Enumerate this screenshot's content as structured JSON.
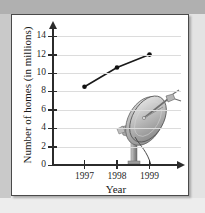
{
  "figure": {
    "panel_name": "line-graph-panel",
    "illustration": "satellite-dish-illustration"
  },
  "chart_data": {
    "type": "line",
    "title": "",
    "xlabel": "Year",
    "ylabel": "Number of homes (in millions)",
    "categories": [
      "1997",
      "1998",
      "1999"
    ],
    "x": [
      1997,
      1998,
      1999
    ],
    "values": [
      8.5,
      10.6,
      12.0
    ],
    "series": [
      {
        "name": "Number of homes",
        "values": [
          8.5,
          10.6,
          12.0
        ]
      }
    ],
    "xlim": [
      1996.5,
      1999.6
    ],
    "ylim": [
      0,
      15
    ],
    "yticks": [
      0,
      2,
      4,
      6,
      8,
      10,
      12,
      14
    ],
    "ytick_labels": [
      "0",
      "2",
      "4",
      "6",
      "8",
      "10",
      "12",
      "14"
    ],
    "xticks": [
      1997,
      1998,
      1999
    ],
    "xtick_labels": [
      "1997",
      "1998",
      "1999"
    ],
    "grid": true,
    "grid_axis": "y",
    "legend": false,
    "legend_position": "none",
    "marker": "filled-circle",
    "line_color": "#1a1a1a",
    "marker_color": "#111111",
    "grid_color": "#dcdcdc",
    "axis_color": "#2b2b2b",
    "annotations": []
  },
  "colors": {
    "panel_background": "#ffffff",
    "panel_border": "#4a4a4a",
    "page_band_top": "#b0b0b0",
    "page_band_left": "#c9c9c9",
    "page_background": "#f2f2f2",
    "dish_gray": "#9a9a9a"
  }
}
